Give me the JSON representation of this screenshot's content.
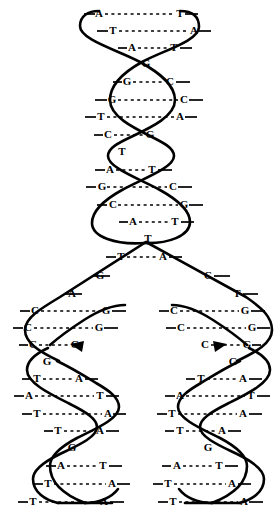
{
  "figure": {
    "background_color": "#ffffff",
    "stroke_color": "#000000",
    "bond_style": "dashed",
    "parent_helix": {
      "name": "parent-duplex",
      "rungs": [
        {
          "left": "A",
          "right": "T",
          "y": 14,
          "x1": 99,
          "x2": 180,
          "paired": true
        },
        {
          "left": "T",
          "right": "A",
          "y": 31,
          "x1": 113,
          "x2": 194,
          "paired": true
        },
        {
          "left": "A",
          "right": "T",
          "y": 48,
          "x1": 132,
          "x2": 174,
          "paired": true
        },
        {
          "left": "G",
          "right": "",
          "y": 64,
          "x1": 146,
          "x2": 146,
          "paired": false
        },
        {
          "left": "G",
          "right": "C",
          "y": 82,
          "x1": 127,
          "x2": 170,
          "paired": true
        },
        {
          "left": "G",
          "right": "C",
          "y": 100,
          "x1": 112,
          "x2": 184,
          "paired": true
        },
        {
          "left": "T",
          "right": "A",
          "y": 117,
          "x1": 101,
          "x2": 180,
          "paired": true
        },
        {
          "left": "C",
          "right": "G",
          "y": 135,
          "x1": 108,
          "x2": 150,
          "paired": true
        },
        {
          "left": "T",
          "right": "",
          "y": 152,
          "x1": 122,
          "x2": 122,
          "paired": false
        },
        {
          "left": "A",
          "right": "T",
          "y": 170,
          "x1": 110,
          "x2": 152,
          "paired": true
        },
        {
          "left": "G",
          "right": "C",
          "y": 187,
          "x1": 102,
          "x2": 173,
          "paired": true
        },
        {
          "left": "C",
          "right": "G",
          "y": 205,
          "x1": 113,
          "x2": 184,
          "paired": true
        },
        {
          "left": "A",
          "right": "T",
          "y": 222,
          "x1": 133,
          "x2": 175,
          "paired": true
        },
        {
          "left": "T",
          "right": "",
          "y": 239,
          "x1": 148,
          "x2": 148,
          "paired": false
        },
        {
          "left": "T",
          "right": "A",
          "y": 257,
          "x1": 121,
          "x2": 163,
          "paired": true
        }
      ]
    },
    "fork": {
      "name": "replication-fork",
      "apex_x": 144,
      "apex_y": 243,
      "left_free_bases": [
        {
          "base": "G",
          "x": 100,
          "y": 276
        },
        {
          "base": "A",
          "x": 72,
          "y": 294
        }
      ],
      "right_free_bases": [
        {
          "base": "C",
          "x": 208,
          "y": 276
        },
        {
          "base": "T",
          "x": 237,
          "y": 294
        }
      ]
    },
    "daughter_left": {
      "name": "daughter-duplex-left",
      "rungs": [
        {
          "left": "C",
          "right": "G",
          "y": 311,
          "x1": 35,
          "x2": 106,
          "paired": true
        },
        {
          "left": "C",
          "right": "G",
          "y": 328,
          "x1": 28,
          "x2": 99,
          "paired": true
        },
        {
          "left": "C",
          "right": "G",
          "y": 345,
          "x1": 33,
          "x2": 75,
          "paired": true
        },
        {
          "left": "G",
          "right": "",
          "y": 362,
          "x1": 47,
          "x2": 47,
          "paired": false
        },
        {
          "left": "T",
          "right": "A",
          "y": 379,
          "x1": 37,
          "x2": 79,
          "paired": true
        },
        {
          "left": "A",
          "right": "T",
          "y": 396,
          "x1": 29,
          "x2": 100,
          "paired": true
        },
        {
          "left": "T",
          "right": "A",
          "y": 414,
          "x1": 37,
          "x2": 108,
          "paired": true
        },
        {
          "left": "T",
          "right": "A",
          "y": 431,
          "x1": 58,
          "x2": 100,
          "paired": true
        },
        {
          "left": "G",
          "right": "",
          "y": 448,
          "x1": 72,
          "x2": 72,
          "paired": false
        },
        {
          "left": "A",
          "right": "T",
          "y": 466,
          "x1": 61,
          "x2": 103,
          "paired": true
        },
        {
          "left": "T",
          "right": "A",
          "y": 484,
          "x1": 48,
          "x2": 112,
          "paired": true
        },
        {
          "left": "T",
          "right": "A",
          "y": 502,
          "x1": 33,
          "x2": 104,
          "paired": true
        }
      ]
    },
    "daughter_right": {
      "name": "daughter-duplex-right",
      "rungs": [
        {
          "left": "C",
          "right": "G",
          "y": 311,
          "x1": 174,
          "x2": 245,
          "paired": true
        },
        {
          "left": "C",
          "right": "G",
          "y": 328,
          "x1": 181,
          "x2": 252,
          "paired": true
        },
        {
          "left": "C",
          "right": "G",
          "y": 345,
          "x1": 205,
          "x2": 247,
          "paired": true
        },
        {
          "left": "G",
          "right": "",
          "y": 362,
          "x1": 233,
          "x2": 233,
          "paired": false
        },
        {
          "left": "T",
          "right": "A",
          "y": 379,
          "x1": 201,
          "x2": 243,
          "paired": true
        },
        {
          "left": "A",
          "right": "T",
          "y": 396,
          "x1": 180,
          "x2": 251,
          "paired": true
        },
        {
          "left": "T",
          "right": "A",
          "y": 414,
          "x1": 172,
          "x2": 243,
          "paired": true
        },
        {
          "left": "T",
          "right": "A",
          "y": 431,
          "x1": 180,
          "x2": 222,
          "paired": true
        },
        {
          "left": "G",
          "right": "",
          "y": 448,
          "x1": 208,
          "x2": 208,
          "paired": false
        },
        {
          "left": "A",
          "right": "T",
          "y": 466,
          "x1": 177,
          "x2": 219,
          "paired": true
        },
        {
          "left": "T",
          "right": "A",
          "y": 484,
          "x1": 168,
          "x2": 232,
          "paired": true
        },
        {
          "left": "T",
          "right": "A",
          "y": 502,
          "x1": 173,
          "x2": 244,
          "paired": true
        }
      ]
    }
  }
}
